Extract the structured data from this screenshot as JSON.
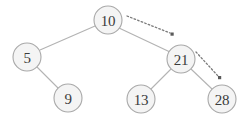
{
  "diagram": {
    "type": "binary-search-tree",
    "title": "",
    "background_color": "#ffffff",
    "node_fill_color": "#f4f4f4",
    "node_stroke_color": "#a8a8a8",
    "edge_color": "#b3b3b3",
    "label_color": "#3b3b3b",
    "pointer_color": "#5a5a5a",
    "nodes": [
      {
        "id": "n10",
        "label": "10",
        "cx": 108,
        "cy": 20,
        "r": 14
      },
      {
        "id": "n5",
        "label": "5",
        "cx": 27,
        "cy": 57,
        "r": 14
      },
      {
        "id": "n21",
        "label": "21",
        "cx": 181,
        "cy": 59,
        "r": 14
      },
      {
        "id": "n9",
        "label": "9",
        "cx": 68,
        "cy": 98,
        "r": 14
      },
      {
        "id": "n13",
        "label": "13",
        "cx": 141,
        "cy": 99,
        "r": 14
      },
      {
        "id": "n28",
        "label": "28",
        "cx": 222,
        "cy": 99,
        "r": 14
      }
    ],
    "edges": [
      {
        "id": "e-10-5",
        "from": "n10",
        "to": "n5",
        "x1": 95,
        "y1": 26,
        "x2": 40,
        "y2": 50
      },
      {
        "id": "e-10-21",
        "from": "n10",
        "to": "n21",
        "x1": 119,
        "y1": 28,
        "x2": 170,
        "y2": 52
      },
      {
        "id": "e-5-9",
        "from": "n5",
        "to": "n9",
        "x1": 37,
        "y1": 67,
        "x2": 58,
        "y2": 88
      },
      {
        "id": "e-21-13",
        "from": "n21",
        "to": "n13",
        "x1": 171,
        "y1": 69,
        "x2": 151,
        "y2": 89
      },
      {
        "id": "e-21-28",
        "from": "n21",
        "to": "n28",
        "x1": 191,
        "y1": 69,
        "x2": 212,
        "y2": 89
      }
    ],
    "pointers": [
      {
        "id": "p-root-right",
        "x1": 127,
        "y1": 16,
        "x2": 172,
        "y2": 34
      },
      {
        "id": "p-21-right",
        "x1": 196,
        "y1": 52,
        "x2": 220,
        "y2": 78
      }
    ]
  }
}
